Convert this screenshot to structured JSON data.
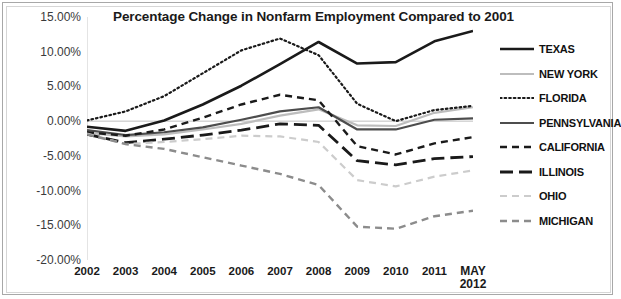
{
  "chart_data": {
    "type": "line",
    "title": "Percentage Change in Nonfarm Employment Compared to 2001",
    "xlabel": "",
    "ylabel": "",
    "ylim": [
      -20,
      15
    ],
    "ytick_values": [
      15,
      10,
      5,
      0,
      -5,
      -10,
      -15,
      -20
    ],
    "ytick_labels": [
      "15.00%",
      "10.00%",
      "5.00%",
      "0.00%",
      "-5.00%",
      "-10.00%",
      "-15.00%",
      "-20.00%"
    ],
    "categories": [
      "2002",
      "2003",
      "2004",
      "2005",
      "2006",
      "2007",
      "2008",
      "2009",
      "2010",
      "2011",
      "MAY 2012"
    ],
    "x_tick_labels": [
      {
        "line1": "2002",
        "line2": ""
      },
      {
        "line1": "2003",
        "line2": ""
      },
      {
        "line1": "2004",
        "line2": ""
      },
      {
        "line1": "2005",
        "line2": ""
      },
      {
        "line1": "2006",
        "line2": ""
      },
      {
        "line1": "2007",
        "line2": ""
      },
      {
        "line1": "2008",
        "line2": ""
      },
      {
        "line1": "2009",
        "line2": ""
      },
      {
        "line1": "2010",
        "line2": ""
      },
      {
        "line1": "2011",
        "line2": ""
      },
      {
        "line1": "MAY",
        "line2": "2012"
      }
    ],
    "grid": false,
    "zero_line": true,
    "legend_position": "right",
    "series": [
      {
        "name": "TEXAS",
        "color": "#1a1a1a",
        "width": 2.6,
        "dash": "none",
        "values": [
          -0.8,
          -1.4,
          0.1,
          2.4,
          5.1,
          8.2,
          11.4,
          8.3,
          8.5,
          11.5,
          13.0
        ]
      },
      {
        "name": "NEW YORK",
        "color": "#bdbdbd",
        "width": 2.2,
        "dash": "none",
        "values": [
          -1.7,
          -2.2,
          -1.9,
          -1.2,
          -0.4,
          0.8,
          1.7,
          -0.6,
          -0.7,
          1.2,
          2.0
        ]
      },
      {
        "name": "FLORIDA",
        "color": "#1a1a1a",
        "width": 2.2,
        "dash": "dotted",
        "values": [
          0.1,
          1.4,
          3.6,
          6.9,
          10.2,
          11.9,
          9.5,
          2.5,
          0.0,
          1.6,
          2.2
        ]
      },
      {
        "name": "PENNSYLVANIA",
        "color": "#4d4d4d",
        "width": 2.2,
        "dash": "none",
        "values": [
          -1.3,
          -2.0,
          -1.6,
          -0.9,
          0.2,
          1.4,
          2.0,
          -1.2,
          -1.2,
          0.2,
          0.4
        ]
      },
      {
        "name": "CALIFORNIA",
        "color": "#1a1a1a",
        "width": 2.4,
        "dash": "dashed",
        "values": [
          -1.6,
          -2.1,
          -1.2,
          0.5,
          2.4,
          3.8,
          3.0,
          -3.6,
          -4.8,
          -3.2,
          -2.3
        ]
      },
      {
        "name": "ILLINOIS",
        "color": "#1a1a1a",
        "width": 2.8,
        "dash": "longdash",
        "values": [
          -1.9,
          -3.1,
          -2.6,
          -2.0,
          -1.3,
          -0.4,
          -0.6,
          -5.7,
          -6.3,
          -5.4,
          -5.1
        ]
      },
      {
        "name": "OHIO",
        "color": "#cccccc",
        "width": 2.2,
        "dash": "dashed",
        "values": [
          -1.8,
          -3.3,
          -3.0,
          -2.6,
          -2.1,
          -2.2,
          -3.0,
          -8.5,
          -9.4,
          -8.0,
          -7.1
        ]
      },
      {
        "name": "MICHIGAN",
        "color": "#8c8c8c",
        "width": 2.4,
        "dash": "dashed",
        "values": [
          -1.9,
          -3.3,
          -4.0,
          -5.2,
          -6.4,
          -7.6,
          -9.2,
          -15.2,
          -15.5,
          -13.7,
          -12.9
        ]
      }
    ]
  },
  "legend": {
    "items": [
      {
        "label": "TEXAS"
      },
      {
        "label": "NEW YORK"
      },
      {
        "label": "FLORIDA"
      },
      {
        "label": "PENNSYLVANIA"
      },
      {
        "label": "CALIFORNIA"
      },
      {
        "label": "ILLINOIS"
      },
      {
        "label": "OHIO"
      },
      {
        "label": "MICHIGAN"
      }
    ]
  }
}
